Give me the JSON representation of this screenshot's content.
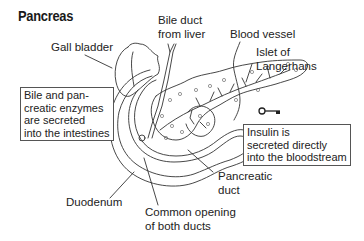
{
  "title": "Pancreas",
  "labels": {
    "gall_bladder": "Gall bladder",
    "bile_duct_line1": "Bile duct",
    "bile_duct_line2": "from liver",
    "blood_vessel": "Blood vessel",
    "islet_line1": "Islet of",
    "islet_line2": "Langerhans",
    "pancreatic_duct_line1": "Pancreatic",
    "pancreatic_duct_line2": "duct",
    "duodenum": "Duodenum",
    "common_opening_line1": "Common opening",
    "common_opening_line2": "of both ducts"
  },
  "boxes": {
    "exocrine": {
      "lines": [
        "Bile and pan-",
        "creatic enzymes",
        "are secreted",
        "into the intestines"
      ]
    },
    "endocrine": {
      "lines": [
        "Insulin is",
        "secreted directly",
        "into the bloodstream"
      ]
    }
  },
  "icons": {
    "key": "key-icon"
  },
  "colors": {
    "line": "#333333",
    "text": "#222222",
    "background": "#ffffff"
  }
}
